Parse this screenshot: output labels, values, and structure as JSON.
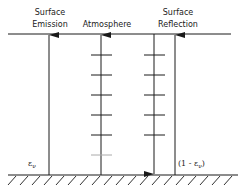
{
  "diagram": {
    "columns": [
      {
        "title_line1": "Surface",
        "title_line2": "Emission"
      },
      {
        "title_line1": "",
        "title_line2": "Atmosphere"
      },
      {
        "title_line1": "Surface",
        "title_line2": "Reflection"
      }
    ],
    "emission_coefficient_label": "ε",
    "emission_coefficient_sub": "ν",
    "reflection_coefficient_label_open": "(1 - ε",
    "reflection_coefficient_sub": "ν",
    "reflection_coefficient_label_close": ")",
    "atmosphere_layer_count_up": 6,
    "atmosphere_layer_count_down": 5,
    "colors": {
      "line": "#1a1a1a",
      "faint": "#aaaaaa",
      "background": "#ffffff"
    }
  }
}
